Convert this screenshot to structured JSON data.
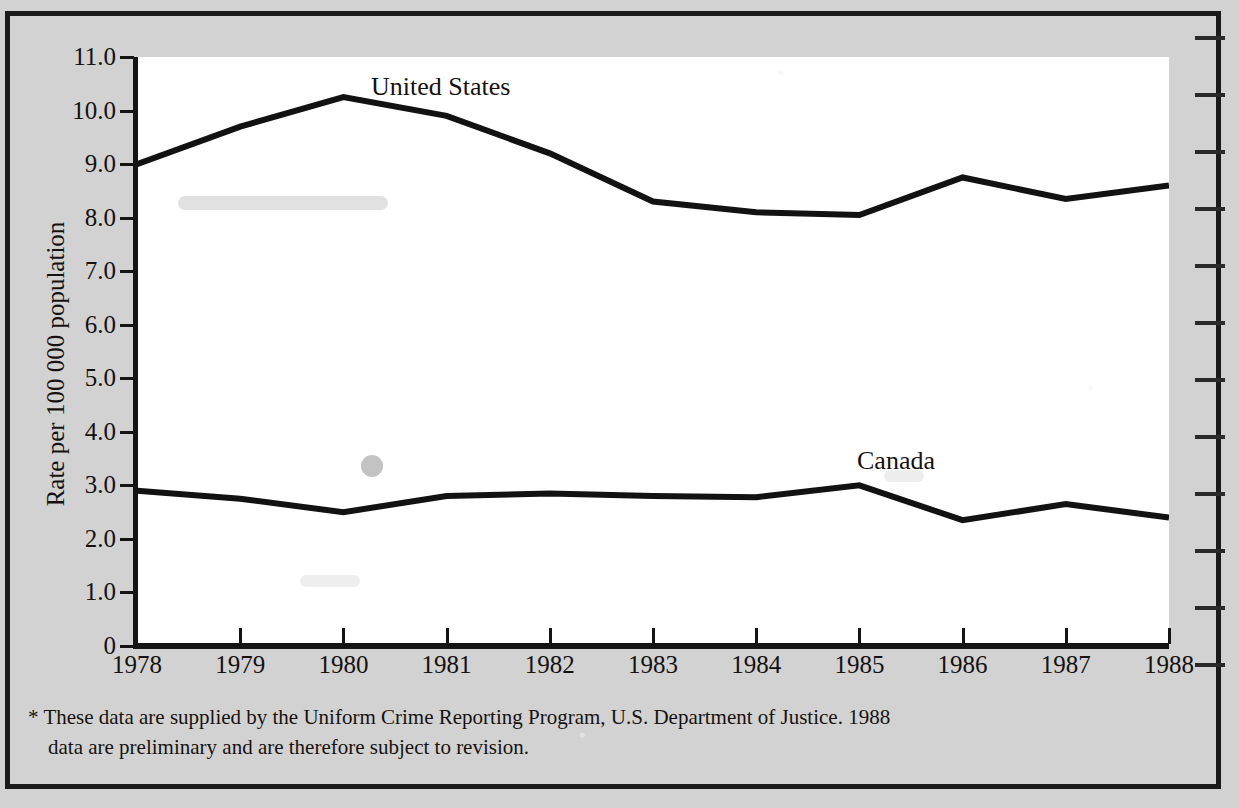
{
  "chart_data": {
    "type": "line",
    "title": "",
    "xlabel": "",
    "ylabel": "Rate per 100 000 population",
    "x": [
      1978,
      1979,
      1980,
      1981,
      1982,
      1983,
      1984,
      1985,
      1986,
      1987,
      1988
    ],
    "categories": [
      "1978",
      "1979",
      "1980",
      "1981",
      "1982",
      "1983",
      "1984",
      "1985",
      "1986",
      "1987",
      "1988"
    ],
    "series": [
      {
        "name": "United States",
        "values": [
          9.0,
          9.7,
          10.25,
          9.9,
          9.2,
          8.3,
          8.1,
          8.05,
          8.75,
          8.35,
          8.6
        ]
      },
      {
        "name": "Canada",
        "values": [
          2.9,
          2.75,
          2.5,
          2.8,
          2.85,
          2.8,
          2.78,
          3.0,
          2.35,
          2.65,
          2.4
        ]
      }
    ],
    "ylim": [
      0,
      11
    ],
    "xlim": [
      1978,
      1988
    ],
    "ytick_labels": [
      "11.0",
      "10.0",
      "9.0",
      "8.0",
      "7.0",
      "6.0",
      "5.0",
      "4.0",
      "3.0",
      "2.0",
      "1.0",
      "0"
    ],
    "ytick_values": [
      11.0,
      10.0,
      9.0,
      8.0,
      7.0,
      6.0,
      5.0,
      4.0,
      3.0,
      2.0,
      1.0,
      0
    ],
    "grid": false,
    "legend_position": "inline-annotation",
    "annotations": [
      {
        "text": "United States",
        "x": 1980.9,
        "y": 10.75
      },
      {
        "text": "Canada",
        "x": 1985.9,
        "y": 3.65
      }
    ],
    "line_color": "#121212"
  },
  "footnote": {
    "marker": "*",
    "line1": "These data are supplied by the Uniform Crime Reporting Program, U.S. Department of Justice. 1988",
    "line2": "data are preliminary and are therefore subject to revision."
  },
  "colors": {
    "page_background": "#d2d2d2",
    "plot_background": "#ffffff",
    "frame": "#1a1a1a",
    "ink": "#15110f"
  }
}
